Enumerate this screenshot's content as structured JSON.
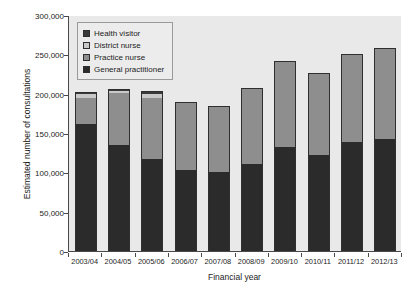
{
  "chart_data": {
    "type": "bar",
    "stacked": true,
    "title": "",
    "xlabel": "Financial year",
    "ylabel": "Estimated number of consultations",
    "categories": [
      "2003/04",
      "2004/05",
      "2005/06",
      "2006/07",
      "2007/08",
      "2008/09",
      "2009/10",
      "2010/11",
      "2011/12",
      "2012/13"
    ],
    "ylim": [
      0,
      300000
    ],
    "ytick_labels": [
      "0",
      "50,000",
      "100,000",
      "150,000",
      "200,000",
      "250,000",
      "300,000"
    ],
    "ytick_values": [
      0,
      50000,
      100000,
      150000,
      200000,
      250000,
      300000
    ],
    "grid": false,
    "legend_position": "upper left",
    "series": [
      {
        "name": "General practitioner",
        "color": "#2b2b2b",
        "values": [
          161000,
          135000,
          117000,
          103000,
          100000,
          110000,
          132000,
          122000,
          138000,
          142000
        ]
      },
      {
        "name": "Practice nurse",
        "color": "#8e8e8e",
        "values": [
          34000,
          66000,
          78000,
          86000,
          84000,
          97000,
          109000,
          104000,
          112000,
          116000
        ]
      },
      {
        "name": "District nurse",
        "color": "#c9c9c9",
        "values": [
          5000,
          3000,
          5000,
          0,
          0,
          0,
          0,
          0,
          0,
          0
        ]
      },
      {
        "name": "Health visitor",
        "color": "#3a3a3a",
        "values": [
          2000,
          2000,
          3000,
          0,
          0,
          0,
          0,
          0,
          0,
          0
        ]
      }
    ],
    "totals": [
      202000,
      206000,
      203000,
      189000,
      184000,
      207000,
      241000,
      226000,
      250000,
      258000
    ]
  },
  "legend": {
    "items": [
      {
        "label": "Health visitor",
        "color": "#3a3a3a"
      },
      {
        "label": "District nurse",
        "color": "#c9c9c9"
      },
      {
        "label": "Practice nurse",
        "color": "#8e8e8e"
      },
      {
        "label": "General practitioner",
        "color": "#2b2b2b"
      }
    ]
  }
}
